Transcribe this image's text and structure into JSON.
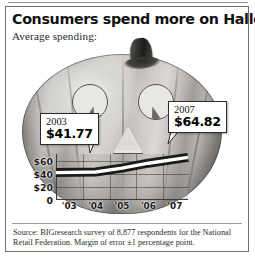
{
  "headline": "Consumers spend more on Halloween",
  "subhead": "Average spending:",
  "callouts": [
    {
      "year": "2003",
      "amount": "$41.77"
    },
    {
      "year": "2007",
      "amount": "$64.82"
    }
  ],
  "source": "Source: BIGresearch survey of 8,877 respondents for the National Retail Federation. Margin of error ±1 percentage point.",
  "graphic": {
    "subject": "jack-o-lantern",
    "stem": "pumpkin-stem",
    "eye_left": "left-eye",
    "eye_right": "right-eye",
    "nose": "triangle-nose",
    "mouth": "line-chart-mouth"
  },
  "chart_data": {
    "type": "line",
    "title": "Consumers spend more on Halloween",
    "subtitle": "Average spending:",
    "xlabel": "",
    "ylabel": "",
    "categories": [
      "'03",
      "'04",
      "'05",
      "'06",
      "'07"
    ],
    "values": [
      41.77,
      42.6,
      48.5,
      56.0,
      64.82
    ],
    "ylim": [
      0,
      70
    ],
    "yticks": [
      0,
      20,
      40,
      60
    ],
    "ytick_labels": [
      "0",
      "$20",
      "$40",
      "$60"
    ],
    "grid": true,
    "legend": "none",
    "annotations": [
      {
        "category": "'03",
        "label": "2003",
        "value_label": "$41.77"
      },
      {
        "category": "'07",
        "label": "2007",
        "value_label": "$64.82"
      }
    ]
  },
  "colors": {
    "ink": "#111111",
    "frame": "#6f6f6f",
    "line": "#1a1a1a",
    "line_fill": "#ffffff",
    "plot_bg": "#adaaa6",
    "callout_bg": "#ffffff"
  }
}
